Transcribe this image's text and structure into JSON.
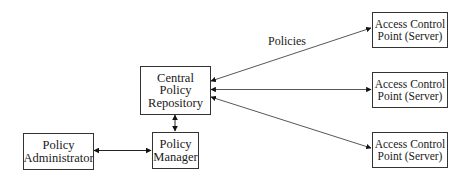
{
  "diagram": {
    "nodes": {
      "repository": {
        "line1": "Central",
        "line2": "Policy",
        "line3": "Repository"
      },
      "manager": {
        "line1": "Policy",
        "line2": "Manager"
      },
      "administrator": {
        "line1": "Policy",
        "line2": "Administrator"
      },
      "acp1": {
        "line1": "Access Control",
        "line2": "Point (Server)"
      },
      "acp2": {
        "line1": "Access Control",
        "line2": "Point (Server)"
      },
      "acp3": {
        "line1": "Access Control",
        "line2": "Point (Server)"
      }
    },
    "edge_label": "Policies",
    "edges": [
      {
        "from": "administrator",
        "to": "manager",
        "type": "bidirectional"
      },
      {
        "from": "manager",
        "to": "repository",
        "type": "bidirectional"
      },
      {
        "from": "repository",
        "to": "acp1",
        "type": "bidirectional"
      },
      {
        "from": "repository",
        "to": "acp2",
        "type": "bidirectional"
      },
      {
        "from": "repository",
        "to": "acp3",
        "type": "bidirectional"
      }
    ]
  }
}
